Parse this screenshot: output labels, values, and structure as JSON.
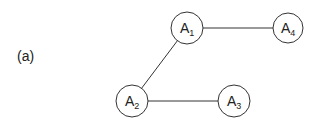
{
  "figure": {
    "panel_label": "(a)",
    "nodes": [
      {
        "id": "A1",
        "base": "A",
        "sub": "1",
        "cx": 187,
        "cy": 28,
        "r": 16
      },
      {
        "id": "A2",
        "base": "A",
        "sub": "2",
        "cx": 132,
        "cy": 101,
        "r": 16
      },
      {
        "id": "A3",
        "base": "A",
        "sub": "3",
        "cx": 234,
        "cy": 101,
        "r": 16
      },
      {
        "id": "A4",
        "base": "A",
        "sub": "4",
        "cx": 288,
        "cy": 28,
        "r": 15
      }
    ],
    "edges": [
      {
        "from": "A1",
        "to": "A4"
      },
      {
        "from": "A1",
        "to": "A2"
      },
      {
        "from": "A2",
        "to": "A3"
      }
    ],
    "colors": {
      "stroke": "#333333",
      "fill": "#ffffff",
      "text": "#222222"
    }
  }
}
